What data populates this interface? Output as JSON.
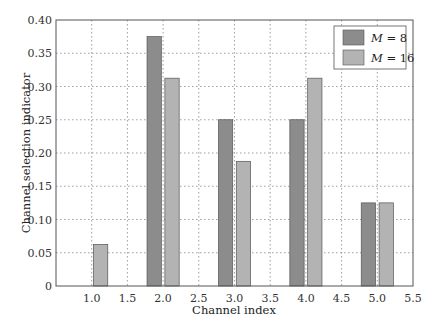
{
  "chart_data": {
    "type": "bar",
    "title": "",
    "xlabel": "Channel index",
    "ylabel": "Channel selection indicator",
    "categories": [
      "1.0",
      "2.0",
      "3.0",
      "4.0",
      "5.0"
    ],
    "x": [
      1,
      2,
      3,
      4,
      5
    ],
    "series": [
      {
        "name": "M = 8",
        "values": [
          0,
          0.375,
          0.25,
          0.25,
          0.125
        ],
        "color": "#8c8c8c"
      },
      {
        "name": "M = 16",
        "values": [
          0.0625,
          0.3125,
          0.1875,
          0.3125,
          0.125
        ],
        "color": "#b3b3b3"
      }
    ],
    "xlim": [
      0.5,
      5.5
    ],
    "ylim": [
      0,
      0.4
    ],
    "xticks": [
      "1.0",
      "1.5",
      "2.0",
      "2.5",
      "3.0",
      "3.5",
      "4.0",
      "4.5",
      "5.0",
      "5.5"
    ],
    "yticks": [
      "0",
      "0.05",
      "0.10",
      "0.15",
      "0.20",
      "0.25",
      "0.30",
      "0.35",
      "0.40"
    ],
    "grid": true,
    "legend_position": "upper right"
  },
  "legend": {
    "m8_var": "M",
    "m8_rest": " = 8",
    "m16_var": "M",
    "m16_rest": " = 16"
  }
}
